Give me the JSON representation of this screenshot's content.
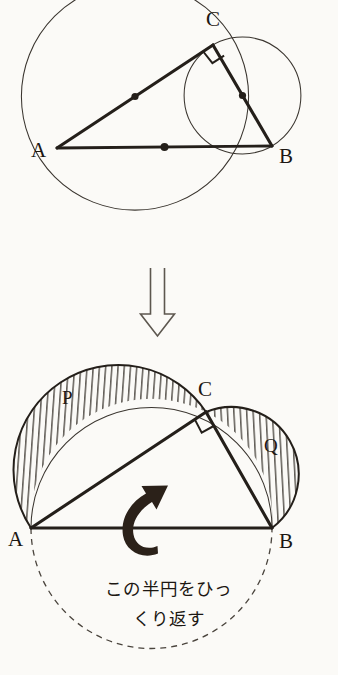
{
  "figure": {
    "background_color": "#fbfaf7",
    "ink_color": "#241f1a",
    "title": "",
    "top_diagram": {
      "name": "right-triangle-with-three-circles",
      "points": {
        "A": {
          "x": 57,
          "y": 148,
          "label": "A",
          "label_x": 31,
          "label_y": 157
        },
        "B": {
          "x": 272,
          "y": 146,
          "label": "B",
          "label_x": 279,
          "label_y": 163
        },
        "C": {
          "x": 213,
          "y": 45,
          "label": "C",
          "label_x": 206,
          "label_y": 26
        }
      },
      "circles": [
        {
          "name": "circle-on-AC",
          "cx": 135,
          "cy": 96.5,
          "r": 113.6
        },
        {
          "name": "circle-on-CB",
          "cx": 242.5,
          "cy": 95.5,
          "r": 58.4
        }
      ],
      "midpoints": [
        {
          "name": "midpoint-AC",
          "x": 135,
          "y": 96.5
        },
        {
          "name": "midpoint-CB",
          "x": 242.5,
          "y": 95.5
        },
        {
          "name": "midpoint-AB",
          "x": 164.5,
          "y": 147
        }
      ],
      "right_angle_at": "C"
    },
    "transition_arrow": {
      "name": "down-block-arrow",
      "direction": "down",
      "x": 157,
      "y_top": 268,
      "y_bottom": 336
    },
    "bottom_diagram": {
      "name": "lune-of-hippocrates",
      "points": {
        "A": {
          "x": 31,
          "y": 528,
          "label": "A",
          "label_x": 8,
          "label_y": 544
        },
        "B": {
          "x": 272,
          "y": 528,
          "label": "B",
          "label_x": 279,
          "label_y": 546
        },
        "C": {
          "x": 206,
          "y": 412,
          "label": "C",
          "label_x": 198,
          "label_y": 396
        }
      },
      "semicircles": [
        {
          "name": "semicircle-on-AC",
          "cx": 118.5,
          "cy": 470,
          "r": 104.6
        },
        {
          "name": "semicircle-on-CB",
          "cx": 239,
          "cy": 470,
          "r": 67.3
        },
        {
          "name": "semicircle-on-AB-upper",
          "cx": 151.5,
          "cy": 528,
          "r": 120.5
        },
        {
          "name": "semicircle-on-AB-lower-dashed",
          "cx": 151.5,
          "cy": 528,
          "r": 120.5,
          "style": "dashed"
        }
      ],
      "shaded_regions": [
        {
          "name": "lune-P",
          "label": "P",
          "label_x": 62,
          "label_y": 404,
          "hatch": "vertical"
        },
        {
          "name": "lune-Q",
          "label": "Q",
          "label_x": 264,
          "label_y": 452,
          "hatch": "vertical"
        }
      ],
      "rotation_arrow": {
        "name": "flip-curved-arrow",
        "cx": 145,
        "cy": 525
      },
      "right_angle_at": "C"
    },
    "caption": {
      "line1": "この半円をひっ",
      "line2": "くり返す",
      "full_text": "この半円をひっくり返す"
    }
  }
}
